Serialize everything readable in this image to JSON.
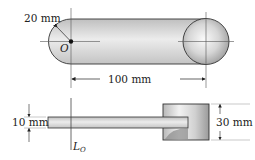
{
  "top_view": {
    "radius_label": "20 mm",
    "center_label": "O",
    "length_label": "100 mm"
  },
  "side_view": {
    "thickness_label": "10 mm",
    "disc_height_label": "30 mm",
    "axis_label_main": "L",
    "axis_label_sub": "O"
  },
  "colors": {
    "bar_fill": "#d2d2d2",
    "outline": "#333333",
    "disc_light": "#f4f4f4",
    "disc_dark": "#9a9a9a"
  }
}
